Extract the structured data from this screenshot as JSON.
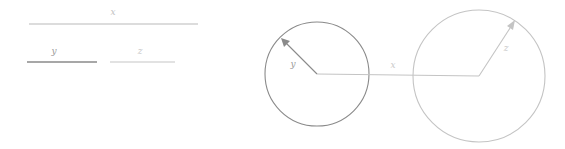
{
  "figure": {
    "background_color": "#ffffff",
    "width": 565,
    "height": 149,
    "panels": [
      {
        "name": "interval-panel",
        "description": "three labeled horizontal line segments",
        "segments": [
          {
            "id": "segment-x",
            "label": "x",
            "color": "#b9b9b9",
            "x1": 29,
            "x2": 198,
            "y": 24,
            "thickness": 1.1,
            "label_x": 113,
            "label_y": 15
          },
          {
            "id": "segment-y",
            "label": "y",
            "color": "#8a8a8a",
            "x1": 27,
            "x2": 97,
            "y": 62,
            "thickness": 1.6,
            "label_x": 54,
            "label_y": 54
          },
          {
            "id": "segment-z",
            "label": "z",
            "color": "#c6c6c6",
            "x1": 110,
            "x2": 175,
            "y": 62,
            "thickness": 1.1,
            "label_x": 140,
            "label_y": 54
          }
        ]
      },
      {
        "name": "circles-panel",
        "description": "two circles joined by a horizontal segment with radius vectors",
        "circles": [
          {
            "id": "circle-left",
            "cx": 317,
            "cy": 74,
            "r": 52,
            "color": "#8a8a8a",
            "thickness": 1.1
          },
          {
            "id": "circle-right",
            "cx": 479,
            "cy": 76,
            "r": 66,
            "color": "#c4c4c4",
            "thickness": 1.1
          }
        ],
        "vectors": [
          {
            "id": "vector-y",
            "label": "y",
            "color": "#8a8a8a",
            "x1": 317,
            "y1": 74,
            "x2": 283,
            "y2": 40,
            "thickness": 1.1,
            "arrowhead": true,
            "label_x": 293,
            "label_y": 66
          },
          {
            "id": "vector-x",
            "label": "x",
            "color": "#c4c4c4",
            "x1": 317,
            "y1": 74,
            "x2": 479,
            "y2": 76,
            "thickness": 1.1,
            "arrowhead": false,
            "label_x": 393,
            "label_y": 68
          },
          {
            "id": "vector-z",
            "label": "z",
            "color": "#c4c4c4",
            "x1": 479,
            "y1": 76,
            "x2": 514,
            "y2": 22,
            "thickness": 1.1,
            "arrowhead": true,
            "label_x": 505,
            "label_y": 50
          }
        ]
      }
    ]
  }
}
